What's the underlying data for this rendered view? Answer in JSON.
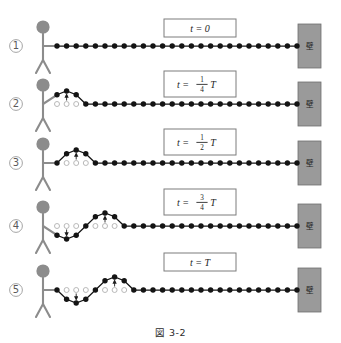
{
  "figure": {
    "caption": "図 3-2",
    "rows": [
      {
        "number": "①",
        "time_label": "t = 0",
        "time_lhs": "t",
        "time_eq": "=",
        "time_rhs": "0",
        "time_num": "",
        "time_den": "",
        "time_suffix": "",
        "wall_char": "壁"
      },
      {
        "number": "②",
        "time_label": "t = (1/4)T",
        "time_lhs": "t",
        "time_eq": "=",
        "time_rhs": "",
        "time_num": "1",
        "time_den": "4",
        "time_suffix": "T",
        "wall_char": "壁"
      },
      {
        "number": "③",
        "time_label": "t = (1/2)T",
        "time_lhs": "t",
        "time_eq": "=",
        "time_rhs": "",
        "time_num": "1",
        "time_den": "2",
        "time_suffix": "T",
        "wall_char": "壁"
      },
      {
        "number": "④",
        "time_label": "t = (3/4)T",
        "time_lhs": "t",
        "time_eq": "=",
        "time_rhs": "",
        "time_num": "3",
        "time_den": "4",
        "time_suffix": "T",
        "wall_char": "壁"
      },
      {
        "number": "⑤",
        "time_label": "t = T",
        "time_lhs": "t",
        "time_eq": "=",
        "time_rhs": "T",
        "time_num": "",
        "time_den": "",
        "time_suffix": "",
        "wall_char": "壁"
      }
    ]
  },
  "colors": {
    "dot_filled": "#141414",
    "dot_hollow_stroke": "#b9b9b9",
    "rope_line": "#141414",
    "wall_fill": "#9a9a9a",
    "wall_stroke": "#6f6f6f",
    "person_stroke": "#8c8c8c",
    "head_fill": "#8c8c8c",
    "box_stroke": "#7d7d7d",
    "arrow": "#1d1d1d",
    "background": "#ffffff"
  },
  "chart_data": {
    "type": "line",
    "title": "図 3-2",
    "xlabel": "",
    "ylabel": "",
    "x_spacing_px": 9.6,
    "amplitude_px": 13,
    "series": [
      {
        "name": "t = 0",
        "displacements": [
          0,
          0,
          0,
          0,
          0,
          0,
          0,
          0,
          0,
          0,
          0,
          0,
          0,
          0,
          0,
          0,
          0,
          0,
          0,
          0,
          0,
          0,
          0,
          0,
          0,
          0
        ]
      },
      {
        "name": "t = (1/4)T",
        "displacements": [
          0.71,
          1.0,
          0.71,
          0,
          0,
          0,
          0,
          0,
          0,
          0,
          0,
          0,
          0,
          0,
          0,
          0,
          0,
          0,
          0,
          0,
          0,
          0,
          0,
          0,
          0,
          0
        ]
      },
      {
        "name": "t = (1/2)T",
        "displacements": [
          0,
          0.71,
          1.0,
          0.71,
          0,
          0,
          0,
          0,
          0,
          0,
          0,
          0,
          0,
          0,
          0,
          0,
          0,
          0,
          0,
          0,
          0,
          0,
          0,
          0,
          0,
          0
        ]
      },
      {
        "name": "t = (3/4)T",
        "displacements": [
          -0.71,
          -1.0,
          -0.71,
          0,
          0.71,
          1.0,
          0.71,
          0,
          0,
          0,
          0,
          0,
          0,
          0,
          0,
          0,
          0,
          0,
          0,
          0,
          0,
          0,
          0,
          0,
          0,
          0
        ]
      },
      {
        "name": "t = T",
        "displacements": [
          0,
          -0.71,
          -1.0,
          -0.71,
          0,
          0.71,
          1.0,
          0.71,
          0,
          0,
          0,
          0,
          0,
          0,
          0,
          0,
          0,
          0,
          0,
          0,
          0,
          0,
          0,
          0,
          0,
          0
        ]
      }
    ]
  }
}
